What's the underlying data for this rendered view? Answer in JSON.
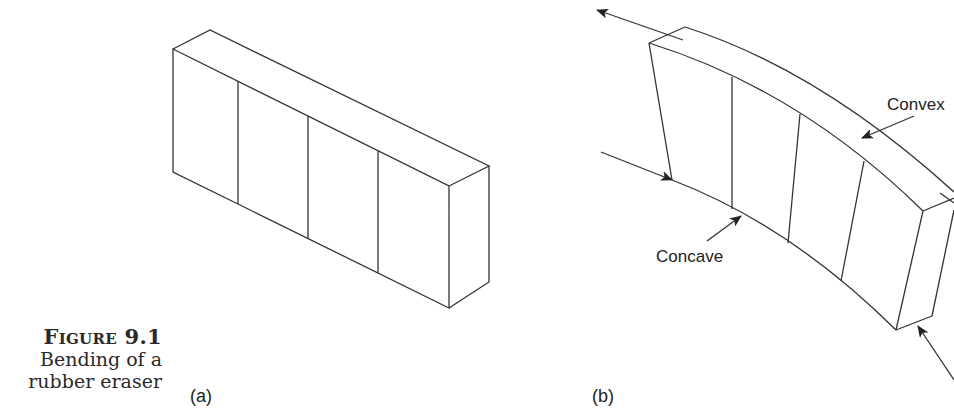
{
  "figure": {
    "number_label": "Figure 9.1",
    "caption_line1": "Bending of a",
    "caption_line2": "rubber eraser"
  },
  "panels": [
    {
      "id": "a",
      "label": "(a)",
      "description": "Undeformed rubber eraser block with four vertical lines marking sections"
    },
    {
      "id": "b",
      "label": "(b)",
      "description": "Bent rubber eraser showing convex and concave surfaces with applied forces"
    }
  ],
  "annotations": {
    "convex": "Convex",
    "concave": "Concave"
  },
  "colors": {
    "line": "#333333",
    "text": "#222222",
    "background": "#ffffff"
  }
}
